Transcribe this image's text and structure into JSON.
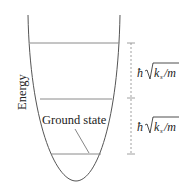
{
  "diagram": {
    "type": "quantum harmonic oscillator energy levels",
    "y_axis_label": "Energy",
    "levels": [
      {
        "name": "ground",
        "label": "Ground state"
      },
      {
        "name": "first-excited"
      },
      {
        "name": "second-excited"
      }
    ],
    "spacing_labels": [
      {
        "prefix": "ħ",
        "radicand": "k",
        "subscript": "s",
        "divisor": "/m"
      },
      {
        "prefix": "ħ",
        "radicand": "k",
        "subscript": "s",
        "divisor": "/m"
      }
    ],
    "colors": {
      "curve": "#555555",
      "levels": "#8a8a8a",
      "dashed": "#888888",
      "text": "#222222"
    }
  }
}
